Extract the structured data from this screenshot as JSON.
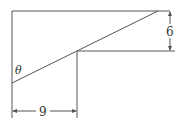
{
  "diagram": {
    "type": "geometry-figure",
    "angle_label": "θ",
    "dimensions": [
      {
        "label": "6",
        "orientation": "vertical",
        "description": "height of step"
      },
      {
        "label": "9",
        "orientation": "horizontal",
        "description": "width to step"
      }
    ],
    "stroke_color": "#555555",
    "background": "#ffffff"
  }
}
